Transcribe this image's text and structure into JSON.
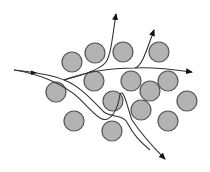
{
  "diagram": {
    "colors": {
      "obstacle_fill": "#b3b3b3",
      "obstacle_stroke": "#555555",
      "path_stroke": "#333333",
      "arrow": "#111111"
    },
    "obstacle_count": 15,
    "path_count": 5
  }
}
